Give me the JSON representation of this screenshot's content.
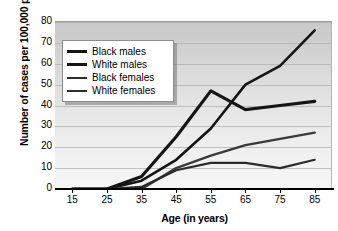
{
  "chart_data": {
    "type": "line",
    "title": "",
    "xlabel": "Age (in years)",
    "ylabel": "Number of cases per 100,000 persons",
    "x": [
      15,
      25,
      35,
      45,
      55,
      65,
      75,
      85
    ],
    "xticklabels": [
      "15",
      "25",
      "35",
      "45",
      "55",
      "65",
      "75",
      "85"
    ],
    "yticklabels": [
      "0",
      "10",
      "20",
      "30",
      "40",
      "50",
      "60",
      "70",
      "80"
    ],
    "yticks": [
      0,
      10,
      20,
      30,
      40,
      50,
      60,
      70,
      80
    ],
    "xlim": [
      10,
      90
    ],
    "ylim": [
      0,
      80
    ],
    "grid": "horizontal",
    "legend_position": "upper-left-inside",
    "series": [
      {
        "name": "Black males",
        "color": "#151515",
        "width": 3.2,
        "values": [
          0,
          0,
          6,
          25,
          47,
          38,
          40,
          42
        ]
      },
      {
        "name": "White males",
        "color": "#151515",
        "width": 2.6,
        "values": [
          0,
          0,
          4,
          14,
          29,
          50,
          59,
          76
        ]
      },
      {
        "name": "Black females",
        "color": "#3a3a3a",
        "width": 2.4,
        "values": [
          0,
          0,
          0,
          10,
          16,
          21,
          24,
          27
        ]
      },
      {
        "name": "White females",
        "color": "#2b2b2b",
        "width": 2.2,
        "values": [
          0,
          0,
          1,
          9,
          12.5,
          12.5,
          10,
          14
        ]
      }
    ]
  },
  "legend": {
    "items": [
      {
        "label": "Black males"
      },
      {
        "label": "White males"
      },
      {
        "label": "Black females"
      },
      {
        "label": "White females"
      }
    ]
  }
}
